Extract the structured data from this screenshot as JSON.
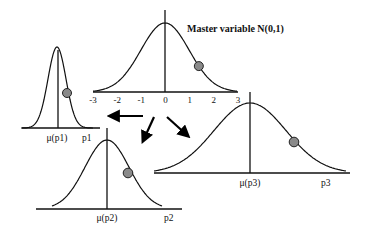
{
  "title": "Master variable N(0,1)",
  "master": {
    "ticks": [
      "-3",
      "-2",
      "-1",
      "0",
      "1",
      "2",
      "3"
    ],
    "distribution": "N(0,1)",
    "dot_value": 1.4
  },
  "panels": [
    {
      "id": "p1",
      "mean_label": "μ(p1)",
      "axis_label": "p1",
      "shape": "narrow"
    },
    {
      "id": "p2",
      "mean_label": "μ(p2)",
      "axis_label": "p2",
      "shape": "medium"
    },
    {
      "id": "p3",
      "mean_label": "μ(p3)",
      "axis_label": "p3",
      "shape": "wide"
    }
  ],
  "colors": {
    "dot": "#8a8a8a",
    "line": "#111111"
  }
}
